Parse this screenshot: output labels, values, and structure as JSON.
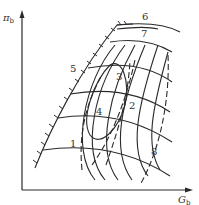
{
  "diagram": {
    "type": "compressor-characteristic-map",
    "y_axis": {
      "symbol": "π",
      "subscript": "b"
    },
    "x_axis": {
      "symbol": "G",
      "subscript": "b"
    },
    "curve_labels": [
      {
        "id": "1",
        "text": "1"
      },
      {
        "id": "2",
        "text": "2"
      },
      {
        "id": "3",
        "text": "3"
      },
      {
        "id": "4",
        "text": "4"
      },
      {
        "id": "5",
        "text": "5"
      },
      {
        "id": "6",
        "text": "6"
      },
      {
        "id": "7",
        "text": "7"
      },
      {
        "id": "8",
        "text": "8"
      }
    ],
    "colors": {
      "line": "#2a2a2a",
      "background": "#ffffff"
    }
  }
}
